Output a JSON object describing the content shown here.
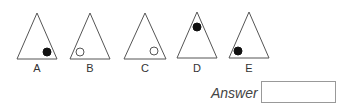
{
  "question": {
    "options": [
      {
        "label": "A",
        "apex": [
          37,
          13
        ],
        "base": [
          17,
          57,
          59
        ],
        "circle": {
          "cx": 47,
          "cy": 52,
          "r": 4,
          "filled": true
        }
      },
      {
        "label": "B",
        "apex": [
          90,
          13
        ],
        "base": [
          70,
          110,
          59
        ],
        "circle": {
          "cx": 80,
          "cy": 52,
          "r": 4,
          "filled": false
        }
      },
      {
        "label": "C",
        "apex": [
          145,
          13
        ],
        "base": [
          124,
          166,
          59
        ],
        "circle": {
          "cx": 154,
          "cy": 51,
          "r": 4,
          "filled": false
        }
      },
      {
        "label": "D",
        "apex": [
          197,
          12
        ],
        "base": [
          177,
          217,
          58
        ],
        "circle": {
          "cx": 197,
          "cy": 27,
          "r": 4,
          "filled": true
        }
      },
      {
        "label": "E",
        "apex": [
          249,
          12
        ],
        "base": [
          229,
          269,
          58
        ],
        "circle": {
          "cx": 238,
          "cy": 51,
          "r": 4,
          "filled": true
        }
      }
    ]
  },
  "answer": {
    "label": "Answer",
    "value": ""
  },
  "colors": {
    "stroke": "#555555",
    "fill_dot": "#111111"
  }
}
